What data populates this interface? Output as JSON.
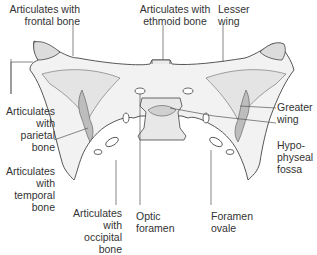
{
  "diagram": {
    "colors": {
      "bone_fill": "#f2f2f2",
      "bone_shade": "#d6d6d6",
      "suture_fill": "#bdbdbd",
      "outline": "#444444",
      "leader": "#555555",
      "text": "#333333"
    },
    "labels": {
      "frontal": [
        "Articulates with",
        "frontal bone"
      ],
      "ethmoid": [
        "Articulates with",
        "ethmoid bone"
      ],
      "lesser_wing": [
        "Lesser",
        "wing"
      ],
      "parietal": [
        "Articulates",
        "with",
        "parietal",
        "bone"
      ],
      "greater_wing": [
        "Greater",
        "wing"
      ],
      "hypophyseal": [
        "Hypo-",
        "physeal",
        "fossa"
      ],
      "temporal": [
        "Articulates",
        "with",
        "temporal",
        "bone"
      ],
      "occipital": [
        "Articulates",
        "with",
        "occipital",
        "bone"
      ],
      "optic": [
        "Optic",
        "foramen"
      ],
      "ovale": [
        "Foramen",
        "ovale"
      ]
    }
  }
}
